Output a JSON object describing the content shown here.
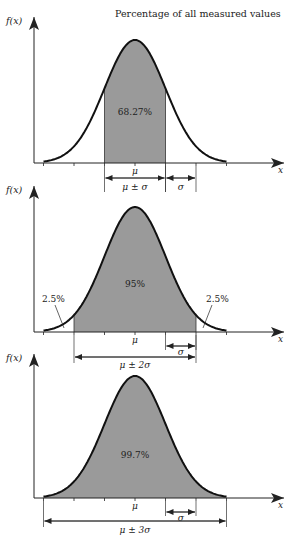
{
  "title": "Percentage of all measured values",
  "colors": {
    "fill": "#9a9a9a",
    "stroke": "#111111",
    "axis": "#222222"
  },
  "axis_labels": {
    "y": "f(x)",
    "x": "x"
  },
  "mean_label": "μ",
  "sigma_label": "σ",
  "panels": [
    {
      "area_label": "68.27%",
      "range_label": "μ ± σ",
      "k": 1
    },
    {
      "area_label": "95%",
      "range_label": "μ ± 2σ",
      "k": 2,
      "tail_left": "2.5%",
      "tail_right": "2.5%"
    },
    {
      "area_label": "99.7%",
      "range_label": "μ ± 3σ",
      "k": 3
    }
  ],
  "chart_data": [
    {
      "type": "area",
      "title": "Percentage of all measured values",
      "xlabel": "x",
      "ylabel": "f(x)",
      "distribution": "normal",
      "shaded_interval": "μ ± σ",
      "shaded_percent": 68.27,
      "ticks": [
        "μ-3σ",
        "μ-2σ",
        "μ-σ",
        "μ",
        "μ+σ",
        "μ+2σ",
        "μ+3σ"
      ],
      "annotations": [
        "68.27%",
        "μ ± σ",
        "σ"
      ]
    },
    {
      "type": "area",
      "xlabel": "x",
      "ylabel": "f(x)",
      "distribution": "normal",
      "shaded_interval": "μ ± 2σ",
      "shaded_percent": 95,
      "tail_percents": [
        2.5,
        2.5
      ],
      "annotations": [
        "95%",
        "2.5%",
        "2.5%",
        "μ ± 2σ",
        "σ"
      ]
    },
    {
      "type": "area",
      "xlabel": "x",
      "ylabel": "f(x)",
      "distribution": "normal",
      "shaded_interval": "μ ± 3σ",
      "shaded_percent": 99.7,
      "annotations": [
        "99.7%",
        "μ ± 3σ",
        "σ"
      ]
    }
  ]
}
